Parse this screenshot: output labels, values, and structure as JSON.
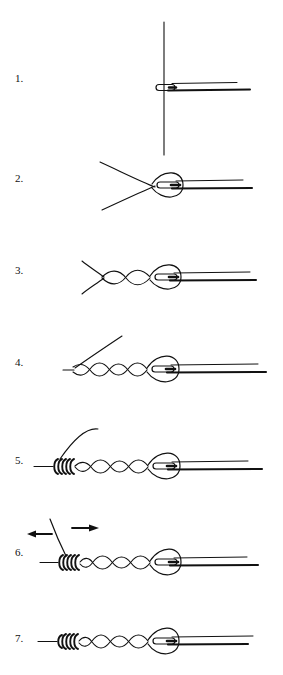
{
  "document": {
    "title": "Fishing Knot Tying Instructions",
    "subject": "improved-clinch-knot-diagram",
    "background_color": "#ffffff",
    "ink_color": "#111111",
    "width": 283,
    "height": 675
  },
  "steps": [
    {
      "id": "step-1",
      "label": "1.",
      "label_x": 15,
      "label_y": 78,
      "description": "Tippet passed through hook eye",
      "elements": [
        "vertical-tippet-line",
        "hook-eye",
        "hook-shank-lines"
      ]
    },
    {
      "id": "step-2",
      "label": "2.",
      "label_x": 15,
      "label_y": 178,
      "description": "Loop formed around hook eye, tag end crossed over standing line",
      "elements": [
        "loop-around-eye",
        "crossed-tag-end",
        "hook-eye",
        "hook-shank-lines"
      ]
    },
    {
      "id": "step-3",
      "label": "3.",
      "label_x": 15,
      "label_y": 270,
      "description": "First twists made in the doubled line",
      "elements": [
        "twist-chain-2",
        "loop-around-eye",
        "hook-eye",
        "hook-shank-lines"
      ]
    },
    {
      "id": "step-4",
      "label": "4.",
      "label_x": 15,
      "label_y": 362,
      "description": "Additional twists formed along standing line",
      "elements": [
        "twist-chain-4",
        "loop-around-eye",
        "hook-eye",
        "hook-shank-lines"
      ]
    },
    {
      "id": "step-5",
      "label": "5.",
      "label_x": 15,
      "label_y": 460,
      "description": "Tag end wrapped back over standing line in tight coils",
      "elements": [
        "tight-coil",
        "twist-chain-4",
        "loop-around-eye",
        "hook-eye",
        "hook-shank-lines"
      ]
    },
    {
      "id": "step-6",
      "label": "6.",
      "label_x": 15,
      "label_y": 552,
      "description": "Pull standing line and tag end in opposite directions to seat the knot",
      "elements": [
        "arrow-left",
        "arrow-right",
        "tight-coil",
        "twist-chain-4",
        "loop-around-eye",
        "hook-eye",
        "hook-shank-lines"
      ],
      "arrows": [
        {
          "name": "arrow-left",
          "direction": "left",
          "x1": 52,
          "x2": 28,
          "y": 534
        },
        {
          "name": "arrow-right",
          "direction": "right",
          "x1": 72,
          "x2": 98,
          "y": 528
        }
      ]
    },
    {
      "id": "step-7",
      "label": "7.",
      "label_x": 15,
      "label_y": 638,
      "description": "Finished knot with tag end trimmed",
      "elements": [
        "tight-coil",
        "twist-chain-4",
        "loop-around-eye",
        "hook-eye",
        "hook-shank-lines"
      ]
    }
  ]
}
